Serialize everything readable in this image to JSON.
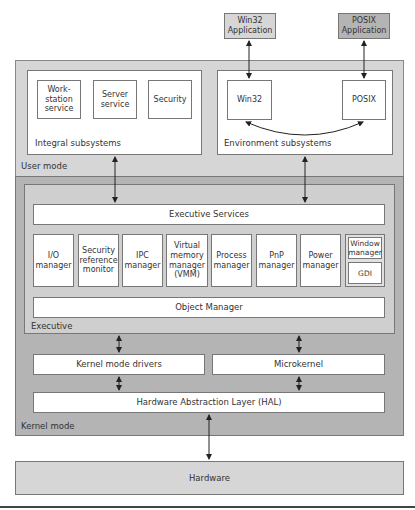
{
  "applications": [
    {
      "label": "Win32 Application"
    },
    {
      "label": "POSIX Application"
    }
  ],
  "user_mode": {
    "label": "User mode",
    "integral_subsystems": {
      "label": "Integral subsystems",
      "items": [
        "Work-station service",
        "Server service",
        "Security"
      ]
    },
    "environment_subsystems": {
      "label": "Environment subsystems",
      "items": [
        "Win32",
        "POSIX"
      ]
    }
  },
  "kernel_mode": {
    "label": "Kernel mode",
    "executive": {
      "label": "Executive",
      "services": "Executive Services",
      "managers": [
        "I/O manager",
        "Security reference monitor",
        "IPC manager",
        "Virtual memory manager (VMM)",
        "Process manager",
        "PnP manager",
        "Power manager"
      ],
      "window_group": [
        "Window manager",
        "GDI"
      ],
      "object_manager": "Object Manager"
    },
    "kernel_mode_drivers": "Kernel mode drivers",
    "microkernel": "Microkernel",
    "hal": "Hardware Abstraction Layer (HAL)"
  },
  "hardware": {
    "label": "Hardware"
  }
}
